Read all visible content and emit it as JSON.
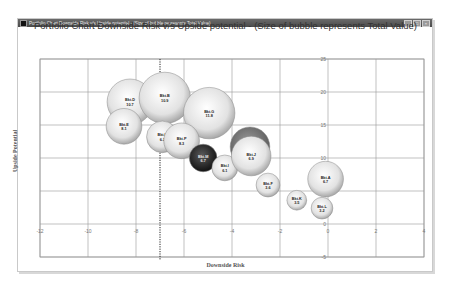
{
  "window": {
    "title": "Portfolio Chart Downside Risk v/s Upside potential - (Size of bubble represents Total Value)",
    "buttons": [
      "_",
      "□",
      "×"
    ]
  },
  "chart_data": {
    "type": "scatter",
    "subtype": "bubble",
    "title": "Portfolio Chart Downside Risk v/s Upside potential - (Size of bubble represents Total Value)",
    "xlabel": "Downside Risk",
    "ylabel": "Upside Potential",
    "xlim": [
      -12,
      4
    ],
    "ylim": [
      -5,
      25
    ],
    "xticks": [
      -12,
      -10,
      -8,
      -6,
      -4,
      -2,
      0,
      2,
      4
    ],
    "yticks": [
      -5,
      0,
      5,
      10,
      15,
      20,
      25
    ],
    "grid": true,
    "reference_line": {
      "orientation": "vertical",
      "x": -7,
      "style": "dotted"
    },
    "points": [
      {
        "label": "Bkt.D",
        "value": "10.7",
        "x": -8.25,
        "y": 18.5,
        "size": 10.7,
        "color": "light"
      },
      {
        "label": "Bkt.B",
        "value": "10.9",
        "x": -6.8,
        "y": 19.1,
        "size": 13.5,
        "color": "light"
      },
      {
        "label": "Bkt.G",
        "value": "11.8",
        "x": -4.95,
        "y": 16.8,
        "size": 13.5,
        "color": "light"
      },
      {
        "label": "Bkt.E",
        "value": "8.1",
        "x": -8.5,
        "y": 14.8,
        "size": 6.5,
        "color": "light"
      },
      {
        "label": "Bkt.H",
        "value": "6.2",
        "x": -6.9,
        "y": 13.2,
        "size": 5.1,
        "color": "light"
      },
      {
        "label": "Bkt.P",
        "value": "8.3",
        "x": -6.1,
        "y": 12.6,
        "size": 6.5,
        "color": "light"
      },
      {
        "label": "Bkt.M",
        "value": "6.7",
        "x": -5.2,
        "y": 10.0,
        "size": 3.9,
        "color": "dark"
      },
      {
        "label": "Bkt.I",
        "value": "6.1",
        "x": -4.3,
        "y": 8.5,
        "size": 3.4,
        "color": "light"
      },
      {
        "label": "",
        "value": "",
        "x": -3.25,
        "y": 11.7,
        "size": 8.0,
        "color": "gray"
      },
      {
        "label": "Bkt.J",
        "value": "6.9",
        "x": -3.2,
        "y": 10.3,
        "size": 8.0,
        "color": "light"
      },
      {
        "label": "Bkt.F",
        "value": "3.6",
        "x": -2.5,
        "y": 5.9,
        "size": 2.9,
        "color": "light"
      },
      {
        "label": "Bkt.A",
        "value": "6.7",
        "x": -0.1,
        "y": 6.8,
        "size": 6.5,
        "color": "light"
      },
      {
        "label": "Bkt.K",
        "value": "3.5",
        "x": -1.3,
        "y": 3.6,
        "size": 2.0,
        "color": "light"
      },
      {
        "label": "Bkt.L",
        "value": "3.2",
        "x": -0.25,
        "y": 2.4,
        "size": 2.4,
        "color": "light"
      }
    ]
  }
}
